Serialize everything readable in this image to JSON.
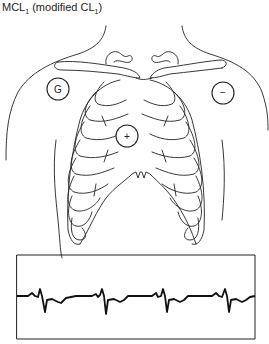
{
  "title": {
    "lead": "MCL",
    "lead_sub": "1",
    "paren_open": " (modified CL",
    "paren_sub": "1",
    "paren_close": ")"
  },
  "electrodes": [
    {
      "label": "G",
      "name": "ground",
      "cx": 58,
      "cy": 89
    },
    {
      "label": "−",
      "name": "negative",
      "cx": 223,
      "cy": 93
    },
    {
      "label": "+",
      "name": "positive",
      "cx": 127,
      "cy": 136
    }
  ],
  "ecg_strip": {
    "beats": 4,
    "color": "#111111"
  }
}
